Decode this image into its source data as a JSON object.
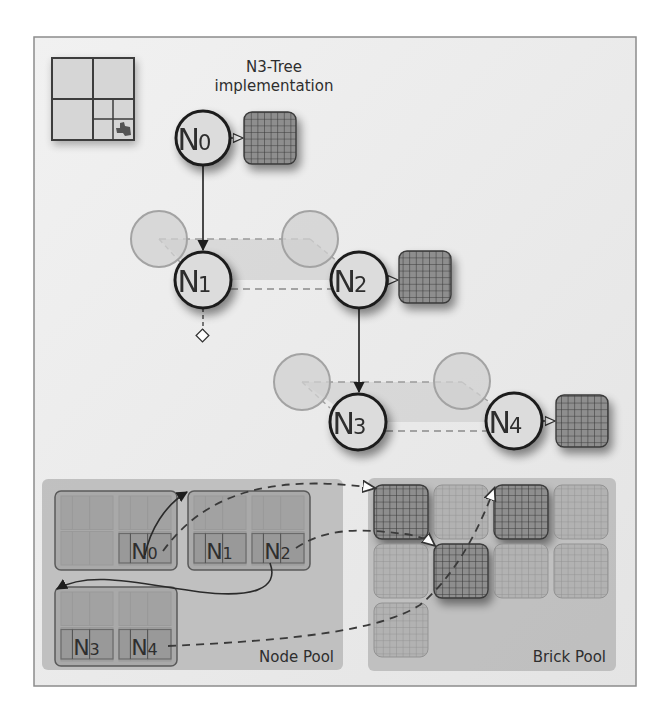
{
  "title": {
    "line1": "N3-Tree",
    "line2": "implementation"
  },
  "tree_nodes": [
    {
      "id": "N0",
      "letter": "N",
      "index": "0",
      "has_brick": true
    },
    {
      "id": "N1",
      "letter": "N",
      "index": "1",
      "has_brick": false
    },
    {
      "id": "N2",
      "letter": "N",
      "index": "2",
      "has_brick": true
    },
    {
      "id": "N3",
      "letter": "N",
      "index": "3",
      "has_brick": false
    },
    {
      "id": "N4",
      "letter": "N",
      "index": "4",
      "has_brick": true
    }
  ],
  "node_pool": {
    "label": "Node Pool",
    "tiles": [
      {
        "slots": [
          "",
          "N0"
        ]
      },
      {
        "slots": [
          "N1",
          "N2"
        ]
      },
      {
        "slots": [
          "N3",
          "N4"
        ]
      }
    ]
  },
  "brick_pool": {
    "label": "Brick Pool",
    "rows": [
      [
        "used",
        "free",
        "used",
        "free"
      ],
      [
        "free",
        "used",
        "free",
        "free"
      ],
      [
        "free"
      ]
    ]
  },
  "colors": {
    "frame_bg": "#ececec",
    "frame_border": "#8c8c8c",
    "pool_bg": "#b9b9b9",
    "node_fill": "#dcdcdc",
    "node_stroke": "#1e1e1e",
    "ghost_fill": "#cfcfcf",
    "ghost_stroke": "#a3a3a3",
    "brick_fill": "#8e8e8e",
    "brick_grid": "#3a3a3a",
    "brick_free_fill": "#b2b2b2",
    "brick_free_grid": "#8f8f8f"
  }
}
